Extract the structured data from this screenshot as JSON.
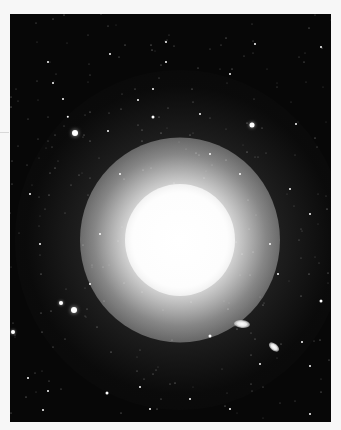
{
  "image": {
    "subject": "elliptical galaxy astrophotograph",
    "background_color": "#f7f7f7",
    "sky_color": "#070707",
    "galaxy_center": {
      "x": 170,
      "y": 226
    },
    "companions": [
      {
        "x": 232,
        "y": 310,
        "w": 16,
        "h": 8,
        "rotate": 5
      },
      {
        "x": 264,
        "y": 333,
        "w": 12,
        "h": 7,
        "rotate": 40
      }
    ],
    "bright_stars": [
      {
        "x": 65,
        "y": 119,
        "r": 3
      },
      {
        "x": 64,
        "y": 296,
        "r": 3
      },
      {
        "x": 51,
        "y": 289,
        "r": 2
      },
      {
        "x": 3,
        "y": 318,
        "r": 2
      },
      {
        "x": 242,
        "y": 111,
        "r": 2.5
      },
      {
        "x": 143,
        "y": 103,
        "r": 1.5
      },
      {
        "x": 311,
        "y": 287,
        "r": 1.5
      },
      {
        "x": 97,
        "y": 379,
        "r": 1.5
      },
      {
        "x": 200,
        "y": 322,
        "r": 1.5
      },
      {
        "x": 58,
        "y": 103,
        "r": 1.2
      },
      {
        "x": 156,
        "y": 28,
        "r": 1
      },
      {
        "x": 156,
        "y": 48,
        "r": 1
      },
      {
        "x": 245,
        "y": 30,
        "r": 1
      },
      {
        "x": 311,
        "y": 33,
        "r": 1
      },
      {
        "x": 128,
        "y": 86,
        "r": 1
      },
      {
        "x": 143,
        "y": 75,
        "r": 1
      },
      {
        "x": 43,
        "y": 69,
        "r": 1
      },
      {
        "x": 53,
        "y": 85,
        "r": 1
      },
      {
        "x": 38,
        "y": 48,
        "r": 1
      },
      {
        "x": 98,
        "y": 117,
        "r": 1
      },
      {
        "x": 286,
        "y": 110,
        "r": 1
      },
      {
        "x": 18,
        "y": 364,
        "r": 1
      },
      {
        "x": 38,
        "y": 377,
        "r": 1
      },
      {
        "x": 33,
        "y": 396,
        "r": 1
      },
      {
        "x": 130,
        "y": 373,
        "r": 1
      },
      {
        "x": 140,
        "y": 395,
        "r": 1
      },
      {
        "x": 292,
        "y": 328,
        "r": 1
      },
      {
        "x": 300,
        "y": 352,
        "r": 1
      },
      {
        "x": 250,
        "y": 350,
        "r": 1
      },
      {
        "x": 280,
        "y": 175,
        "r": 1
      },
      {
        "x": 200,
        "y": 140,
        "r": 1
      },
      {
        "x": 230,
        "y": 160,
        "r": 1
      },
      {
        "x": 90,
        "y": 220,
        "r": 1
      },
      {
        "x": 80,
        "y": 270,
        "r": 1
      },
      {
        "x": 110,
        "y": 160,
        "r": 1
      },
      {
        "x": 260,
        "y": 230,
        "r": 1
      },
      {
        "x": 268,
        "y": 260,
        "r": 1
      },
      {
        "x": 300,
        "y": 200,
        "r": 1
      },
      {
        "x": 20,
        "y": 180,
        "r": 1
      },
      {
        "x": 30,
        "y": 230,
        "r": 1
      },
      {
        "x": 190,
        "y": 100,
        "r": 1
      },
      {
        "x": 220,
        "y": 60,
        "r": 1
      },
      {
        "x": 100,
        "y": 40,
        "r": 1
      },
      {
        "x": 180,
        "y": 385,
        "r": 1
      },
      {
        "x": 220,
        "y": 395,
        "r": 1
      },
      {
        "x": 300,
        "y": 400,
        "r": 1
      }
    ]
  }
}
